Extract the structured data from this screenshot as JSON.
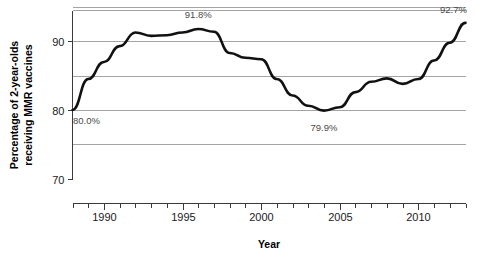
{
  "chart_data": {
    "type": "line",
    "title": "",
    "xlabel": "Year",
    "ylabel": "Percentage of 2-year-olds receiving MMR vaccines",
    "ylabel_line1": "Percentage of 2-year-olds",
    "ylabel_line2": "receiving MMR vaccines",
    "xlim": [
      1988,
      2013
    ],
    "ylim": [
      70,
      94.5
    ],
    "grid": true,
    "gridlines_y": [
      95,
      90,
      85,
      80,
      75
    ],
    "legend": "none",
    "y_ticks": [
      "90",
      "80",
      "70"
    ],
    "y_tick_values": [
      90,
      80,
      70
    ],
    "x_ticks": [
      "1990",
      "1995",
      "2000",
      "2005",
      "2010"
    ],
    "x_tick_values": [
      1990,
      1995,
      2000,
      2005,
      2010
    ],
    "x_minor_tick_values": [
      1988,
      1989,
      1991,
      1992,
      1993,
      1994,
      1996,
      1997,
      1998,
      1999,
      2001,
      2002,
      2003,
      2004,
      2006,
      2007,
      2008,
      2009,
      2011,
      2012,
      2013
    ],
    "x": [
      1988,
      1989,
      1990,
      1991,
      1992,
      1993,
      1994,
      1995,
      1996,
      1997,
      1998,
      1999,
      2000,
      2001,
      2002,
      2003,
      2004,
      2005,
      2006,
      2007,
      2008,
      2009,
      2010,
      2011,
      2012,
      2013
    ],
    "values": [
      80.0,
      84.5,
      87.0,
      89.3,
      91.3,
      90.8,
      90.9,
      91.3,
      91.8,
      91.4,
      88.3,
      87.6,
      87.4,
      84.5,
      82.1,
      80.6,
      79.9,
      80.4,
      82.6,
      84.1,
      84.6,
      83.8,
      84.5,
      87.2,
      89.8,
      92.7
    ],
    "annotations": [
      {
        "label": "80.0%",
        "year": 1988,
        "value": 80.0,
        "position": "below-right"
      },
      {
        "label": "91.8%",
        "year": 1996,
        "value": 91.8,
        "position": "above"
      },
      {
        "label": "79.9%",
        "year": 2004,
        "value": 79.9,
        "position": "below"
      },
      {
        "label": "92.7%",
        "year": 2013,
        "value": 92.7,
        "position": "above-left"
      }
    ],
    "colors": {
      "line": "#111111",
      "grid": "#9a9a9a",
      "axis": "#3a3a3a",
      "annotation_text": "#4a4a4a",
      "background": "#ffffff"
    }
  }
}
